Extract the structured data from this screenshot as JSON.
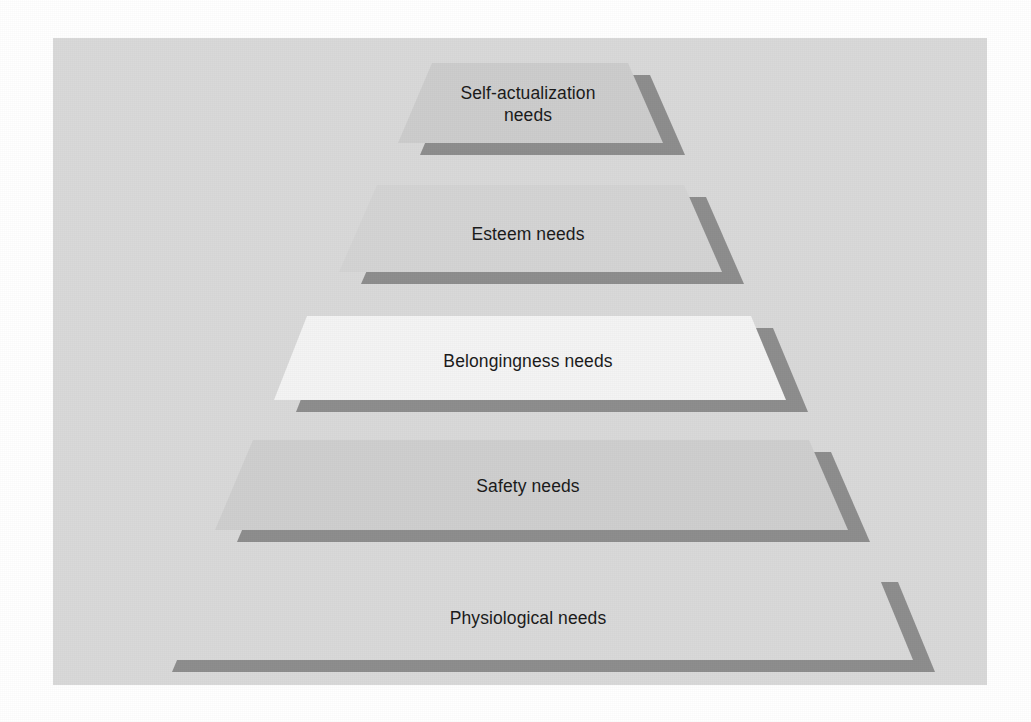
{
  "figure": {
    "type": "pyramid-diagram",
    "level_count": 5,
    "background_color": "#ffffff",
    "panel_color": "#d9d9d9",
    "shadow_color": "#8e8e8e",
    "text_color": "#1b1b1b"
  },
  "panel": {
    "x": 53,
    "y": 38,
    "width": 934,
    "height": 647
  },
  "chart_data": {
    "type": "pyramid",
    "orientation": "apex-top",
    "levels": [
      {
        "rank": 1,
        "label": "Self-actualization\nneeds",
        "label_lines": [
          "Self-actualization",
          "needs"
        ],
        "fill": "#cdcdcd",
        "shadow": "#8e8e8e",
        "top_y": 63,
        "bottom_y": 143,
        "top_left_x": 432,
        "top_right_x": 628,
        "bottom_left_x": 398,
        "bottom_right_x": 663,
        "center_x": 528,
        "center_y": 104
      },
      {
        "rank": 2,
        "label": "Esteem needs",
        "label_lines": [
          "Esteem needs"
        ],
        "fill": "#d4d4d4",
        "shadow": "#8e8e8e",
        "top_y": 185,
        "bottom_y": 272,
        "top_left_x": 377,
        "top_right_x": 684,
        "bottom_left_x": 339,
        "bottom_right_x": 722,
        "center_x": 528,
        "center_y": 234
      },
      {
        "rank": 3,
        "label": "Belongingness needs",
        "label_lines": [
          "Belongingness needs"
        ],
        "fill": "#f4f4f4",
        "shadow": "#8e8e8e",
        "top_y": 316,
        "bottom_y": 400,
        "top_left_x": 307,
        "top_right_x": 751,
        "bottom_left_x": 274,
        "bottom_right_x": 786,
        "center_x": 528,
        "center_y": 361
      },
      {
        "rank": 4,
        "label": "Safety needs",
        "label_lines": [
          "Safety needs"
        ],
        "fill": "#cfcfcf",
        "shadow": "#8e8e8e",
        "top_y": 440,
        "bottom_y": 530,
        "top_left_x": 253,
        "top_right_x": 809,
        "bottom_left_x": 215,
        "bottom_right_x": 848,
        "center_x": 528,
        "center_y": 486
      },
      {
        "rank": 5,
        "label": "Physiological needs",
        "label_lines": [
          "Physiological needs"
        ],
        "fill": "#d9d9d9",
        "shadow": "#8e8e8e",
        "top_y": 570,
        "bottom_y": 660,
        "top_left_x": 188,
        "top_right_x": 876,
        "bottom_left_x": 150,
        "bottom_right_x": 913,
        "center_x": 528,
        "center_y": 618
      }
    ],
    "labels": [
      "Self-actualization needs",
      "Esteem needs",
      "Belongingness needs",
      "Safety needs",
      "Physiological needs"
    ]
  }
}
